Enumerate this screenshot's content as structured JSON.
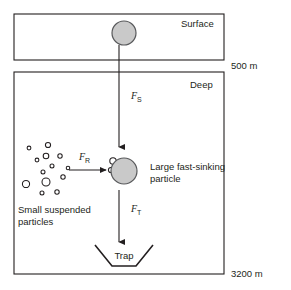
{
  "figure": {
    "background_color": "#ffffff",
    "stroke_color": "#231f20",
    "particle_fill": "#c9c9c9",
    "particle_stroke": "#58595b"
  },
  "boxes": [
    {
      "name": "surface-box",
      "label": "Surface",
      "x": 14,
      "y": 14,
      "width": 210,
      "height": 46
    },
    {
      "name": "deep-box",
      "label": "Deep",
      "x": 14,
      "y": 72,
      "width": 210,
      "height": 202
    }
  ],
  "depth_labels": [
    {
      "name": "depth-500",
      "text": "500 m",
      "x": 231,
      "y": 69
    },
    {
      "name": "depth-3200",
      "text": "3200 m",
      "x": 231,
      "y": 277
    }
  ],
  "forces": [
    {
      "name": "force-sinking",
      "symbol": "F",
      "subscript": "S",
      "label": "F_S",
      "label_x": 131,
      "label_y": 99,
      "arrow": {
        "x1": 119,
        "y1": 46,
        "x2": 119,
        "y2": 148
      },
      "direction": "down"
    },
    {
      "name": "force-repackaging",
      "symbol": "F",
      "subscript": "R",
      "label": "F_R",
      "label_x": 80,
      "label_y": 159,
      "arrow": {
        "x1": 69,
        "y1": 170,
        "x2": 111,
        "y2": 170
      },
      "direction": "right"
    },
    {
      "name": "force-trapping",
      "symbol": "F",
      "subscript": "T",
      "label": "F_T",
      "label_x": 131,
      "label_y": 212,
      "arrow": {
        "x1": 119,
        "y1": 192,
        "x2": 119,
        "y2": 243
      },
      "direction": "down"
    }
  ],
  "particles": {
    "surface_particle": {
      "name": "surface-particle",
      "cx": 124,
      "cy": 33,
      "r": 12
    },
    "large_particle": {
      "name": "large-fast-sinking-particle",
      "cx": 124,
      "cy": 171,
      "r": 13,
      "label_line1": "Large fast-sinking",
      "label_line2": "particle",
      "label_x": 150,
      "label_y": 168
    },
    "attached_small": [
      {
        "name": "attached-particle",
        "cx": 113,
        "cy": 161,
        "r": 3.2
      },
      {
        "name": "attached-particle",
        "cx": 111,
        "cy": 170,
        "r": 2.6
      }
    ],
    "small_suspended": {
      "name": "small-suspended-particles",
      "label_line1": "Small suspended",
      "label_line2": "particles",
      "label_x": 18,
      "label_y": 213,
      "circles": [
        {
          "cx": 29,
          "cy": 148,
          "r": 1.9
        },
        {
          "cx": 48,
          "cy": 145,
          "r": 2.6
        },
        {
          "cx": 46,
          "cy": 156,
          "r": 2.8
        },
        {
          "cx": 37,
          "cy": 160,
          "r": 1.9
        },
        {
          "cx": 60,
          "cy": 156,
          "r": 2.2
        },
        {
          "cx": 52,
          "cy": 166,
          "r": 2.0
        },
        {
          "cx": 68,
          "cy": 168,
          "r": 1.8
        },
        {
          "cx": 43,
          "cy": 172,
          "r": 2.0
        },
        {
          "cx": 63,
          "cy": 177,
          "r": 2.2
        },
        {
          "cx": 26,
          "cy": 184,
          "r": 3.6
        },
        {
          "cx": 46,
          "cy": 182,
          "r": 4.0
        },
        {
          "cx": 42,
          "cy": 193,
          "r": 2.0
        },
        {
          "cx": 57,
          "cy": 192,
          "r": 2.2
        }
      ]
    }
  },
  "trap": {
    "name": "sediment-trap",
    "label": "Trap",
    "label_x": 124,
    "label_y": 259,
    "points": "95,245 112,266 136,266 153,245"
  }
}
